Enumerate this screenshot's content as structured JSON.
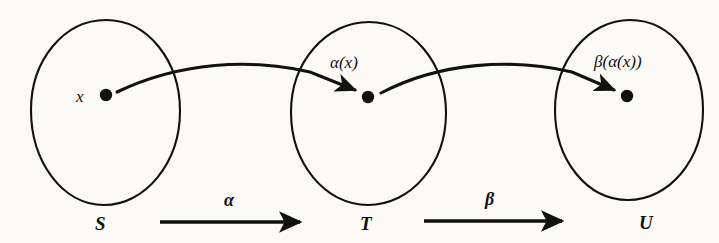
{
  "figure": {
    "kind": "function-composition-diagram",
    "background_color": "#fbfaf7",
    "ink_color": "#111111"
  },
  "sets": [
    {
      "id": "S",
      "label": "S",
      "cx": 105,
      "cy": 112,
      "rx": 75,
      "ry": 92
    },
    {
      "id": "T",
      "label": "T",
      "cx": 368,
      "cy": 113,
      "rx": 78,
      "ry": 91
    },
    {
      "id": "U",
      "label": "U",
      "cx": 629,
      "cy": 110,
      "rx": 74,
      "ry": 90
    }
  ],
  "points": [
    {
      "id": "x",
      "label": "x",
      "set": "S",
      "cx": 106,
      "cy": 95
    },
    {
      "id": "alpha_x",
      "label": "α(x)",
      "set": "T",
      "cx": 368,
      "cy": 97
    },
    {
      "id": "beta_ax",
      "label": "β(α(x))",
      "set": "U",
      "cx": 627,
      "cy": 96
    }
  ],
  "element_arrows": [
    {
      "id": "x-to-alpha-x",
      "from": "x",
      "to": "alpha_x"
    },
    {
      "id": "alpha-x-to-beta-ax",
      "from": "alpha_x",
      "to": "beta_ax"
    }
  ],
  "map_arrows": [
    {
      "id": "alpha",
      "label": "α",
      "from": "S",
      "to": "T",
      "x1": 160,
      "x2": 306,
      "y": 222
    },
    {
      "id": "beta",
      "label": "β",
      "from": "T",
      "to": "U",
      "x1": 424,
      "x2": 568,
      "y": 221
    }
  ]
}
